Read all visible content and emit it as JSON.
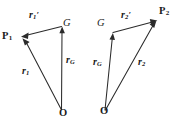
{
  "figure": {
    "background_color": "#ffffff",
    "ink_color": "#2b2b2b",
    "left_diagram": {
      "name": "particle-1-vector-triangle",
      "points": [
        {
          "id": "P1",
          "label": "P",
          "subscript": "1",
          "x": 20,
          "y": 31
        },
        {
          "id": "G",
          "label": "G",
          "subscript": "",
          "x": 63,
          "y": 18
        },
        {
          "id": "O",
          "label": "O",
          "subscript": "",
          "x": 59,
          "y": 108
        }
      ],
      "vectors": [
        {
          "id": "r1prime",
          "base": "r",
          "subscript": "1",
          "prime": "′",
          "from": "G",
          "to": "P1",
          "label_x": 29,
          "label_y": 10
        },
        {
          "id": "rG",
          "base": "r",
          "subscript": "G",
          "prime": "",
          "from": "O",
          "to": "G",
          "label_x": 59,
          "label_y": 55
        },
        {
          "id": "r1",
          "base": "r",
          "subscript": "1",
          "prime": "",
          "from": "O",
          "to": "P1",
          "label_x": 20,
          "label_y": 68
        }
      ]
    },
    "right_diagram": {
      "name": "particle-2-vector-triangle",
      "points": [
        {
          "id": "G",
          "label": "G",
          "subscript": "",
          "x": 97,
          "y": 18
        },
        {
          "id": "P2",
          "label": "P",
          "subscript": "2",
          "x": 159,
          "y": 6
        },
        {
          "id": "O",
          "label": "O",
          "subscript": "",
          "x": 100,
          "y": 106
        }
      ],
      "vectors": [
        {
          "id": "r2prime",
          "base": "r",
          "subscript": "2",
          "prime": "′",
          "from": "G",
          "to": "P2",
          "label_x": 119,
          "label_y": 10
        },
        {
          "id": "rG",
          "base": "r",
          "subscript": "G",
          "prime": "",
          "from": "O",
          "to": "G",
          "label_x": 95,
          "label_y": 57
        },
        {
          "id": "r2",
          "base": "r",
          "subscript": "2",
          "prime": "",
          "from": "O",
          "to": "P2",
          "label_x": 140,
          "label_y": 57
        }
      ]
    }
  }
}
